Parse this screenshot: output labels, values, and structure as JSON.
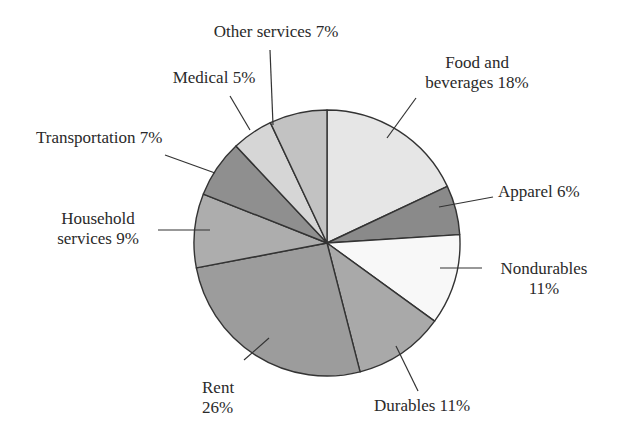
{
  "chart_data": {
    "type": "pie",
    "title": "",
    "start_angle_deg": 90,
    "direction": "clockwise",
    "slices": [
      {
        "label": "Food and beverages",
        "value": 18,
        "display": "Food and\nbeverages 18%",
        "color": "#e6e6e6"
      },
      {
        "label": "Apparel",
        "value": 6,
        "display": "Apparel 6%",
        "color": "#8a8a8a"
      },
      {
        "label": "Nondurables",
        "value": 11,
        "display": "Nondurables\n11%",
        "color": "#f8f8f8"
      },
      {
        "label": "Durables",
        "value": 11,
        "display": "Durables 11%",
        "color": "#a9a9a9"
      },
      {
        "label": "Rent",
        "value": 26,
        "display": "Rent\n26%",
        "color": "#9c9c9c"
      },
      {
        "label": "Household services",
        "value": 9,
        "display": "Household\nservices 9%",
        "color": "#adadad"
      },
      {
        "label": "Transportation",
        "value": 7,
        "display": "Transportation 7%",
        "color": "#8f8f8f"
      },
      {
        "label": "Medical",
        "value": 5,
        "display": "Medical 5%",
        "color": "#d6d6d6"
      },
      {
        "label": "Other services",
        "value": 7,
        "display": "Other services 7%",
        "color": "#c2c2c2"
      }
    ],
    "legend": "none (callout labels with leader lines)"
  },
  "labels": {
    "food_line1": "Food and",
    "food_line2": "beverages 18%",
    "apparel": "Apparel 6%",
    "nondurables_line1": "Nondurables",
    "nondurables_line2": "11%",
    "durables": "Durables 11%",
    "rent_line1": "Rent",
    "rent_line2": "26%",
    "household_line1": "Household",
    "household_line2": "services 9%",
    "transportation": "Transportation 7%",
    "medical": "Medical 5%",
    "other": "Other services 7%"
  },
  "geometry": {
    "cx": 327,
    "cy": 243,
    "r": 133,
    "stroke": "#333333"
  }
}
